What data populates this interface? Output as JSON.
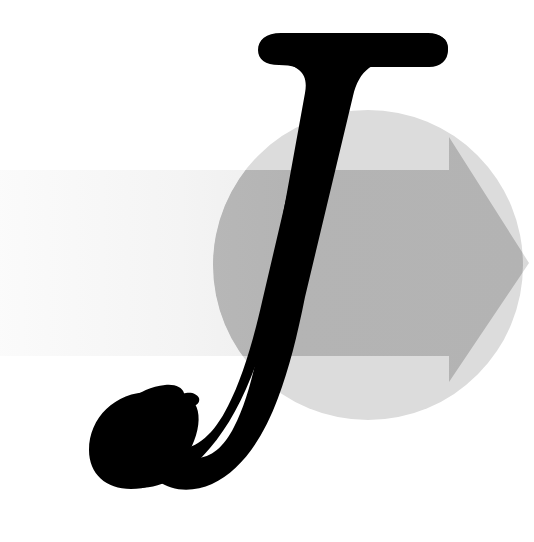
{
  "artwork": {
    "title": "J",
    "letter": "J",
    "description": "Stylized italic serif letter J over a gray circle with a rightward arrow",
    "canvas": {
      "width": 534,
      "height": 542,
      "background": "#ffffff"
    },
    "colors": {
      "background": "#ffffff",
      "letter": "#000000",
      "circle": "#dcdcdc",
      "arrow_light": "#f2f2f2",
      "arrow_mid": "#e4e4e4",
      "arrow_over_circle": "#b3b3b3",
      "arrow_over_circle_light": "#bfbfbf"
    },
    "elements": [
      {
        "name": "circle",
        "shape": "circle",
        "fill": "#dcdcdc",
        "cx": 368,
        "cy": 265,
        "r": 155
      },
      {
        "name": "arrow",
        "shape": "arrow-right",
        "direction": "right",
        "band_top": 170,
        "band_bottom": 356,
        "band_left": 0,
        "head_start_x": 449,
        "head_top_y": 137,
        "head_bottom_y": 382,
        "tip_x": 529,
        "tip_y": 263,
        "gradient_from": "#fbfbfb",
        "gradient_to": "#d9d9d9"
      },
      {
        "name": "letter-j",
        "shape": "glyph",
        "character": "J",
        "fill": "#000000",
        "style": "italic-serif-swash",
        "bbox": {
          "x": 88,
          "y": 33,
          "width": 360,
          "height": 455
        }
      }
    ]
  }
}
